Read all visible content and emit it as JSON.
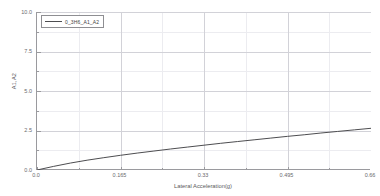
{
  "chart_data": {
    "type": "line",
    "title": "",
    "xlabel": "Lateral Acceleration(g)",
    "ylabel": "A1,A2",
    "xlim": [
      0,
      0.66
    ],
    "ylim": [
      0,
      10
    ],
    "xticks": [
      "0.0",
      "0.165",
      "0.33",
      "0.495",
      "0.66"
    ],
    "xtick_values": [
      0,
      0.165,
      0.33,
      0.495,
      0.66
    ],
    "yticks": [
      "0.0",
      "2.5",
      "5.0",
      "7.5",
      "10.0"
    ],
    "ytick_values": [
      0,
      2.5,
      5.0,
      7.5,
      10.0
    ],
    "grid": true,
    "minor_grid": true,
    "legend_position": "top-left",
    "series": [
      {
        "name": "0_3H6_A1_A2",
        "color": "#4d4d50",
        "x": [
          0,
          0.033,
          0.066,
          0.099,
          0.132,
          0.165,
          0.198,
          0.231,
          0.264,
          0.297,
          0.33,
          0.363,
          0.396,
          0.429,
          0.462,
          0.495,
          0.528,
          0.561,
          0.594,
          0.627,
          0.66
        ],
        "y": [
          0.0,
          0.23,
          0.44,
          0.62,
          0.78,
          0.93,
          1.07,
          1.2,
          1.33,
          1.45,
          1.57,
          1.69,
          1.8,
          1.91,
          2.02,
          2.13,
          2.23,
          2.34,
          2.44,
          2.54,
          2.64
        ]
      }
    ]
  },
  "legend": {
    "entries": [
      {
        "label": "0_3H6_A1_A2"
      }
    ]
  },
  "axes": {
    "x_title": "Lateral Acceleration(g)",
    "y_title": "A1,A2"
  }
}
